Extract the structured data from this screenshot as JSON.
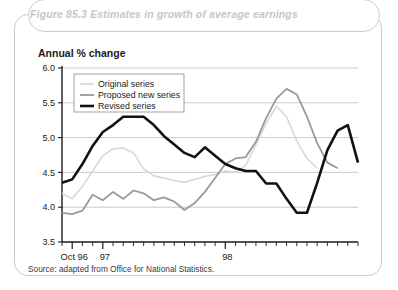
{
  "figure": {
    "title": "Figure 85.3 Estimates in growth of average earnings",
    "axis_title": "Annual % change",
    "source": "Source: adapted from Office for National Statistics."
  },
  "colors": {
    "original": "#d8d8d8",
    "proposed": "#9a9a9a",
    "revised": "#111111",
    "grid": "#bdbdbd",
    "axis": "#1b1b1b",
    "title_text": "#c6c6c6",
    "frame": "#c9c9c9",
    "legend_border": "#8a8a8a"
  },
  "chart_data": {
    "type": "line",
    "title": "Figure 85.3 Estimates in growth of average earnings",
    "xlabel": "",
    "ylabel": "Annual % change",
    "ylim": [
      3.5,
      6.0
    ],
    "yticks": [
      "3.5",
      "4.0",
      "4.5",
      "5.0",
      "5.5",
      "6.0"
    ],
    "ytick_values": [
      3.5,
      4.0,
      4.5,
      5.0,
      5.5,
      6.0
    ],
    "grid": true,
    "legend_position": "top-left",
    "xtick_labels": [
      "Oct 96",
      "97",
      "98"
    ],
    "xtick_label_index": [
      1,
      4,
      16
    ],
    "x_index_count": 26,
    "series": [
      {
        "name": "Original series",
        "color": "#d8d8d8",
        "width": 1.6,
        "values": [
          4.2,
          4.12,
          4.3,
          4.52,
          4.74,
          4.84,
          4.85,
          4.78,
          4.55,
          4.45,
          4.42,
          4.38,
          4.36,
          4.4,
          4.44,
          4.47,
          4.52,
          4.5,
          4.6,
          4.9,
          5.2,
          5.45,
          5.3,
          4.95,
          4.7,
          4.56
        ]
      },
      {
        "name": "Proposed new series",
        "color": "#9a9a9a",
        "width": 1.8,
        "values": [
          3.92,
          3.9,
          3.95,
          4.18,
          4.1,
          4.22,
          4.12,
          4.24,
          4.2,
          4.1,
          4.14,
          4.08,
          3.96,
          4.06,
          4.22,
          4.42,
          4.62,
          4.7,
          4.72,
          4.94,
          5.28,
          5.56,
          5.7,
          5.62,
          5.3,
          4.92,
          4.64,
          4.56
        ]
      },
      {
        "name": "Revised series",
        "color": "#111111",
        "width": 2.6,
        "values": [
          4.35,
          4.4,
          4.62,
          4.88,
          5.08,
          5.18,
          5.3,
          5.3,
          5.3,
          5.18,
          5.02,
          4.9,
          4.78,
          4.72,
          4.86,
          4.74,
          4.62,
          4.56,
          4.52,
          4.52,
          4.34,
          4.34,
          4.12,
          3.92,
          3.92,
          4.35,
          4.82,
          5.1,
          5.18,
          4.64
        ]
      }
    ]
  },
  "legend": {
    "items": [
      {
        "label": "Original series"
      },
      {
        "label": "Proposed new series"
      },
      {
        "label": "Revised series"
      }
    ]
  }
}
